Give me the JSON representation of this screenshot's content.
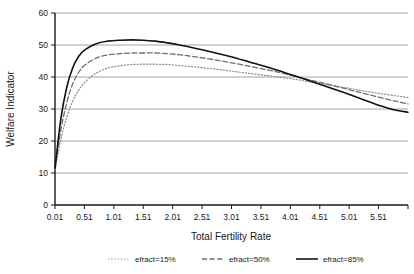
{
  "chart_data": {
    "type": "line",
    "title": "",
    "xlabel": "Total Fertility Rate",
    "ylabel": "Welfare Indicator",
    "xlim": [
      0.01,
      6.01
    ],
    "ylim": [
      0,
      60
    ],
    "xticks": [
      "0.01",
      "0.51",
      "1.01",
      "1.51",
      "2.01",
      "2.51",
      "3.01",
      "3.51",
      "4.01",
      "4.51",
      "5.01",
      "5.51"
    ],
    "xtick_values": [
      0.01,
      0.51,
      1.01,
      1.51,
      2.01,
      2.51,
      3.01,
      3.51,
      4.01,
      4.51,
      5.01,
      5.51
    ],
    "yticks": [
      "0",
      "10",
      "20",
      "30",
      "40",
      "50",
      "60"
    ],
    "ytick_values": [
      0,
      10,
      20,
      30,
      40,
      50,
      60
    ],
    "grid": "horizontal",
    "legend_position": "bottom",
    "x": [
      0.01,
      0.11,
      0.21,
      0.31,
      0.41,
      0.51,
      0.71,
      0.91,
      1.11,
      1.31,
      1.51,
      1.71,
      1.91,
      2.11,
      2.31,
      2.51,
      2.81,
      3.11,
      3.41,
      3.71,
      4.01,
      4.31,
      4.61,
      4.91,
      5.21,
      5.51,
      5.81,
      6.01
    ],
    "series": [
      {
        "name": "efract=15%",
        "style": "dotted",
        "color": "#8c8c8c",
        "peak_x": 1.71,
        "peak_y": 44.0,
        "values": [
          11.0,
          20.5,
          27.5,
          32.4,
          35.8,
          38.2,
          41.2,
          42.8,
          43.5,
          43.9,
          44.0,
          44.0,
          43.9,
          43.6,
          43.3,
          42.9,
          42.3,
          41.6,
          40.9,
          40.2,
          39.5,
          38.6,
          37.7,
          36.8,
          35.8,
          34.9,
          34.1,
          33.6
        ]
      },
      {
        "name": "efract=50%",
        "style": "dashed",
        "color": "#6e6e6e",
        "peak_x": 1.71,
        "peak_y": 47.5,
        "values": [
          11.2,
          23.5,
          32.0,
          37.8,
          41.4,
          43.6,
          45.9,
          46.9,
          47.3,
          47.5,
          47.5,
          47.5,
          47.3,
          47.0,
          46.5,
          46.0,
          45.1,
          44.1,
          43.0,
          41.9,
          40.6,
          39.2,
          37.9,
          36.5,
          35.1,
          33.7,
          32.4,
          31.6
        ]
      },
      {
        "name": "efract=85%",
        "style": "solid",
        "color": "#111111",
        "peak_x": 1.41,
        "peak_y": 51.6,
        "values": [
          11.5,
          27.0,
          36.8,
          42.8,
          46.4,
          48.4,
          50.4,
          51.2,
          51.5,
          51.6,
          51.5,
          51.2,
          50.7,
          50.1,
          49.3,
          48.5,
          47.2,
          45.8,
          44.2,
          42.6,
          40.8,
          39.0,
          37.1,
          35.2,
          33.2,
          31.2,
          29.6,
          29.0
        ]
      }
    ]
  },
  "legend": {
    "items": [
      {
        "label": "efract=15%",
        "style": "dotted"
      },
      {
        "label": "efract=50%",
        "style": "dashed"
      },
      {
        "label": "efract=85%",
        "style": "solid"
      }
    ]
  }
}
